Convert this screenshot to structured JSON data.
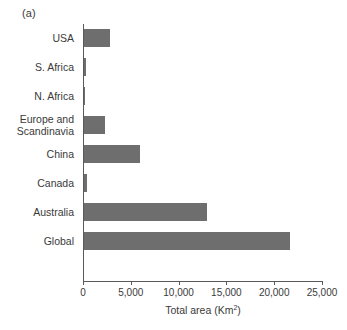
{
  "figure": {
    "panel_label": "(a)",
    "background_color": "#ffffff",
    "bar_color": "#6e6e6e",
    "axis_color": "#5a5a5a",
    "text_color": "#3a3a3a"
  },
  "chart_data": {
    "type": "bar",
    "orientation": "horizontal",
    "title": "",
    "subtitle": "",
    "xlabel": "Total area (Km",
    "xlabel_sup": "2",
    "xlabel_tail": ")",
    "xlabel_full": "Total area (Km2)",
    "ylabel": "",
    "categories": [
      "USA",
      "S. Africa",
      "N. Africa",
      "Europe and\nScandinavia",
      "China",
      "Canada",
      "Australia",
      "Global"
    ],
    "values": [
      2700,
      200,
      100,
      2200,
      5900,
      300,
      12900,
      21500
    ],
    "xlim": [
      0,
      25000
    ],
    "ylim": [
      0,
      8
    ],
    "xticks": [
      0,
      5000,
      10000,
      15000,
      20000,
      25000
    ],
    "xticklabels": [
      "0",
      "5,000",
      "10,000",
      "15,000",
      "20,000",
      "25,000"
    ],
    "grid": false,
    "legend": false,
    "legend_position": "none",
    "annotations": [
      "(a)"
    ]
  }
}
